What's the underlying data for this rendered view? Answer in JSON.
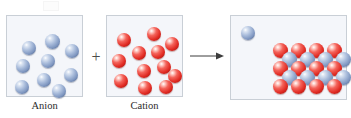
{
  "figure": {
    "type": "chemistry-reaction-diagram",
    "background_color": "#ffffff"
  },
  "colors": {
    "anion_sphere": "#7d95bf",
    "cation_sphere": "#e02a22",
    "panel_fill": "#f4f6fa",
    "panel_border": "#c9cfd6",
    "operator": "#4a4a4a",
    "caption_text": "#2b2b2b"
  },
  "operators": {
    "plus": "+",
    "arrow": "→"
  },
  "panels": [
    {
      "id": "anion",
      "caption": "Anion",
      "sphere_color": "blue",
      "count": 9,
      "spheres": [
        {
          "x": 15,
          "y": 25,
          "d": 14
        },
        {
          "x": 38,
          "y": 18,
          "d": 15
        },
        {
          "x": 58,
          "y": 28,
          "d": 14
        },
        {
          "x": 34,
          "y": 38,
          "d": 14
        },
        {
          "x": 9,
          "y": 43,
          "d": 14
        },
        {
          "x": 30,
          "y": 57,
          "d": 14
        },
        {
          "x": 57,
          "y": 52,
          "d": 14
        },
        {
          "x": 8,
          "y": 64,
          "d": 14
        },
        {
          "x": 45,
          "y": 68,
          "d": 14
        }
      ]
    },
    {
      "id": "cation",
      "caption": "Cation",
      "sphere_color": "red",
      "count": 12,
      "spheres": [
        {
          "x": 10,
          "y": 17,
          "d": 14
        },
        {
          "x": 40,
          "y": 11,
          "d": 14
        },
        {
          "x": 58,
          "y": 21,
          "d": 14
        },
        {
          "x": 25,
          "y": 30,
          "d": 14
        },
        {
          "x": 44,
          "y": 29,
          "d": 14
        },
        {
          "x": 5,
          "y": 38,
          "d": 14
        },
        {
          "x": 30,
          "y": 48,
          "d": 14
        },
        {
          "x": 50,
          "y": 44,
          "d": 14
        },
        {
          "x": 61,
          "y": 53,
          "d": 14
        },
        {
          "x": 7,
          "y": 58,
          "d": 14
        },
        {
          "x": 31,
          "y": 65,
          "d": 14
        },
        {
          "x": 52,
          "y": 64,
          "d": 14
        }
      ]
    },
    {
      "id": "lattice",
      "caption": "",
      "free_spheres": [
        {
          "color": "blue",
          "x": 10,
          "y": 10,
          "d": 14
        }
      ],
      "lattice": {
        "rows": [
          {
            "color": "red",
            "x_start": 42,
            "y": 27,
            "count": 4,
            "step": 18,
            "d": 15
          },
          {
            "color": "blue",
            "x_start": 51,
            "y": 36,
            "count": 4,
            "step": 18,
            "d": 15
          },
          {
            "color": "red",
            "x_start": 42,
            "y": 45,
            "count": 4,
            "step": 18,
            "d": 15
          },
          {
            "color": "blue",
            "x_start": 51,
            "y": 54,
            "count": 4,
            "step": 18,
            "d": 15
          },
          {
            "color": "red",
            "x_start": 42,
            "y": 63,
            "count": 4,
            "step": 18,
            "d": 15
          }
        ],
        "red_count": 12,
        "blue_count": 8
      }
    }
  ]
}
